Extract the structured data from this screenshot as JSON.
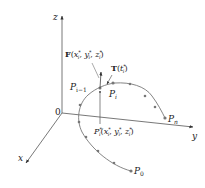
{
  "diagram": {
    "axes": {
      "z_label": "z",
      "y_label": "y",
      "x_label": "x",
      "origin_label": "0"
    },
    "labels": {
      "force": "F(x*ᵢ, y*ᵢ, z*ᵢ)",
      "force_F": "F",
      "force_args": "(x",
      "tangent": "T(t*ᵢ)",
      "tangent_T": "T",
      "p_prev": "P",
      "p_prev_sub": "i−1",
      "p_i": "P",
      "p_i_sub": "i",
      "p_n": "P",
      "p_n_sub": "n",
      "p_0": "P",
      "p_0_sub": "0",
      "p_star": "P",
      "p_star_sup": "*",
      "p_star_sub": "i",
      "p_star_coords": "(x*ᵢ, y*ᵢ, z*ᵢ)"
    },
    "colors": {
      "line": "#444444",
      "point": "#666666",
      "text": "#222222"
    }
  }
}
